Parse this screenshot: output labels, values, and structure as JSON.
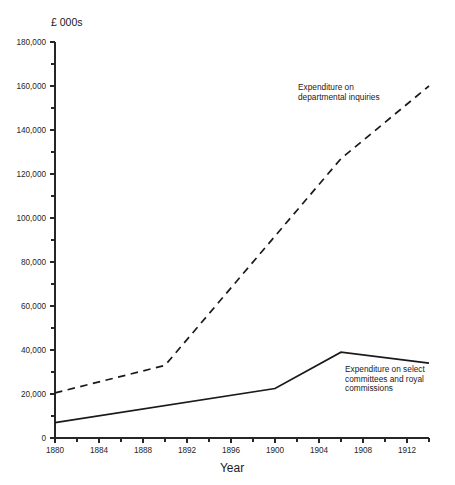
{
  "chart_data": {
    "type": "line",
    "title": "",
    "subtitle": "",
    "ylabel": "£ 000s",
    "xlabel": "Year",
    "xlim": [
      1880,
      1914
    ],
    "ylim": [
      0,
      180000
    ],
    "grid": false,
    "legend_position": "inline-annotations",
    "x_ticks_major": [
      1880,
      1884,
      1888,
      1892,
      1896,
      1900,
      1904,
      1908,
      1912
    ],
    "x_tick_labels": [
      "1880",
      "1884",
      "1888",
      "1892",
      "1896",
      "1900",
      "1904",
      "1908",
      "1912"
    ],
    "x_ticks_minor": [
      1882,
      1886,
      1890,
      1894,
      1898,
      1902,
      1906,
      1910,
      1914
    ],
    "y_ticks_major": [
      0,
      20000,
      40000,
      60000,
      80000,
      100000,
      120000,
      140000,
      160000,
      180000
    ],
    "y_tick_labels": [
      "0",
      "20,000",
      "40,000",
      "60,000",
      "80,000",
      "100,000",
      "120,000",
      "140,000",
      "160,000",
      "180,000"
    ],
    "y_ticks_minor": [
      10000,
      30000,
      50000,
      70000,
      90000,
      110000,
      130000,
      150000,
      170000
    ],
    "series": [
      {
        "name": "Expenditure on departmental inquiries",
        "style": "dashed",
        "annotation": "Expenditure on\ndepartmental inquiries",
        "annotation_lines": [
          "Expenditure on",
          "departmental inquiries"
        ],
        "x": [
          1880,
          1890,
          1906,
          1914
        ],
        "values": [
          20500,
          33000,
          127000,
          160000
        ]
      },
      {
        "name": "Expenditure on select committees and royal commissions",
        "style": "solid",
        "annotation": "Expenditure on select\ncommittees and royal\ncommissions",
        "annotation_lines": [
          "Expenditure on select",
          "committees and royal",
          "commissions"
        ],
        "x": [
          1880,
          1900,
          1906,
          1914
        ],
        "values": [
          7000,
          22500,
          39000,
          34000
        ]
      }
    ]
  },
  "colors": {
    "ink": "#1a1a1a",
    "axis": "#262626",
    "background": "#ffffff"
  }
}
